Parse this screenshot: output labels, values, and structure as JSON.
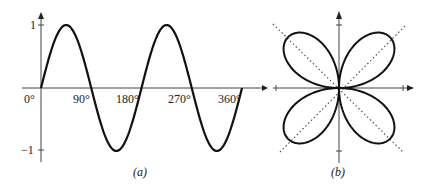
{
  "chart_data": [
    {
      "type": "line",
      "panel": "(a)",
      "function": "sin(2θ)",
      "x": [
        0,
        22.5,
        45,
        67.5,
        90,
        112.5,
        135,
        157.5,
        180,
        202.5,
        225,
        247.5,
        270,
        292.5,
        315,
        337.5,
        360
      ],
      "values": [
        0,
        0.707,
        1,
        0.707,
        0,
        -0.707,
        -1,
        -0.707,
        0,
        0.707,
        1,
        0.707,
        0,
        -0.707,
        -1,
        -0.707,
        0
      ],
      "xticks": [
        "0°",
        "90°",
        "180°",
        "270°",
        "360°"
      ],
      "yticks": [
        "1",
        "−1"
      ],
      "ylim": [
        -1,
        1
      ],
      "xlim": [
        0,
        360
      ],
      "grid": false,
      "caption": "(a)"
    },
    {
      "type": "line",
      "panel": "(b)",
      "function": "polar rose r = sin(2θ) (four petals)",
      "petal_directions_deg": [
        45,
        135,
        225,
        315
      ],
      "dotted_guides_deg": [
        45,
        135
      ],
      "grid": false,
      "caption": "(b)"
    }
  ],
  "panel_a": {
    "y_labels": {
      "top": "1",
      "bottom": "−1"
    },
    "x_labels": [
      "0°",
      "90°",
      "180°",
      "270°",
      "360°"
    ],
    "caption": "(a)"
  },
  "panel_b": {
    "caption": "(b)"
  },
  "colors": {
    "curve": "#111111",
    "axis": "#444444",
    "guide": "#555555"
  }
}
